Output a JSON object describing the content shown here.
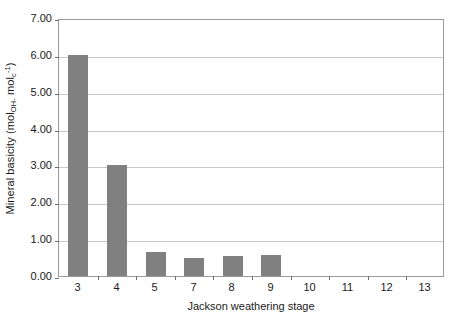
{
  "chart_data": {
    "type": "bar",
    "title": "",
    "subtitle": "",
    "xlabel": "Jackson weathering stage",
    "ylabel_plain": "Mineral basicity (mol OH- mol c -1)",
    "ylabel_parts": {
      "lead": "Mineral basicity (mol",
      "sub1": "OH-",
      "mid": " mol",
      "sub2": "c",
      "sup": "-1",
      "tail": ")"
    },
    "categories": [
      "3",
      "4",
      "5",
      "7",
      "8",
      "9",
      "10",
      "11",
      "12",
      "13"
    ],
    "values": [
      6.0,
      3.0,
      0.65,
      0.48,
      0.53,
      0.58,
      0.0,
      0.0,
      0.0,
      0.0
    ],
    "ylim": [
      0.0,
      7.0
    ],
    "ytick_step": 1.0,
    "yticks": [
      "7.00",
      "6.00",
      "5.00",
      "4.00",
      "3.00",
      "2.00",
      "1.00",
      "0.00"
    ],
    "ytick_values": [
      7.0,
      6.0,
      5.0,
      4.0,
      3.0,
      2.0,
      1.0,
      0.0
    ],
    "grid": true,
    "grid_axis": "y",
    "legend": false,
    "legend_position": "none",
    "series": [
      {
        "name": "Mineral basicity",
        "color": "#808080",
        "values": [
          6.0,
          3.0,
          0.65,
          0.48,
          0.53,
          0.58,
          0.0,
          0.0,
          0.0,
          0.0
        ]
      }
    ],
    "colors": {
      "bar_fill": "#808080",
      "gridline": "#c8c8c8",
      "axis_border": "#9a9a9a",
      "text": "#1a1a1a",
      "background": "#ffffff"
    }
  }
}
